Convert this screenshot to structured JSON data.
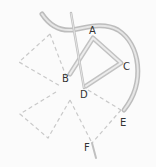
{
  "diagram": {
    "type": "embroidery-stitch-illustration",
    "labels": {
      "A": "A",
      "B": "B",
      "C": "C",
      "D": "D",
      "E": "E",
      "F": "F"
    },
    "colors": {
      "background": "#fbfbfb",
      "thread": "#bdbdbd",
      "thread_highlight": "#e6e6e6",
      "needle": "#c8c8c8",
      "dashed_guides": "#c9c9c9",
      "label_text": "#333333"
    }
  }
}
